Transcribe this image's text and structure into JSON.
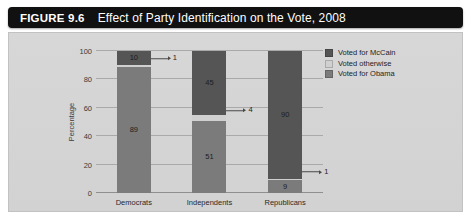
{
  "figure": {
    "number": "FIGURE 9.6",
    "title": "Effect of Party Identification on the Vote, 2008"
  },
  "chart_data": {
    "type": "bar",
    "subtype": "stacked-bar-100",
    "title": "Effect of Party Identification on the Vote, 2008",
    "xlabel": "",
    "ylabel": "Percentage",
    "ylim": [
      0,
      100
    ],
    "yticks": [
      0,
      20,
      40,
      60,
      80,
      100
    ],
    "ytick_labels": [
      "0",
      "20",
      "40",
      "60",
      "80",
      "100"
    ],
    "grid": true,
    "legend_position": "right",
    "categories": [
      "Democrats",
      "Independents",
      "Republicans"
    ],
    "series": [
      {
        "name": "Voted for McCain",
        "color": "#555555",
        "values": [
          10,
          45,
          90
        ]
      },
      {
        "name": "Voted otherwise",
        "color": "#d0d0d0",
        "values": [
          1,
          4,
          1
        ]
      },
      {
        "name": "Voted for Obama",
        "color": "#7b7b7b",
        "values": [
          89,
          51,
          9
        ]
      }
    ],
    "stack_order_bottom_to_top": [
      "Voted for Obama",
      "Voted otherwise",
      "Voted for McCain"
    ],
    "callouts": [
      {
        "category": "Democrats",
        "series": "Voted otherwise",
        "label": "1"
      },
      {
        "category": "Independents",
        "series": "Voted otherwise",
        "label": "4"
      },
      {
        "category": "Republicans",
        "series": "Voted otherwise",
        "label": "1"
      }
    ]
  },
  "colors": {
    "banner_bg": "#111111",
    "banner_text": "#ffffff",
    "panel_bg": "#d5d5d5",
    "gridline": "#a9a9a9"
  }
}
